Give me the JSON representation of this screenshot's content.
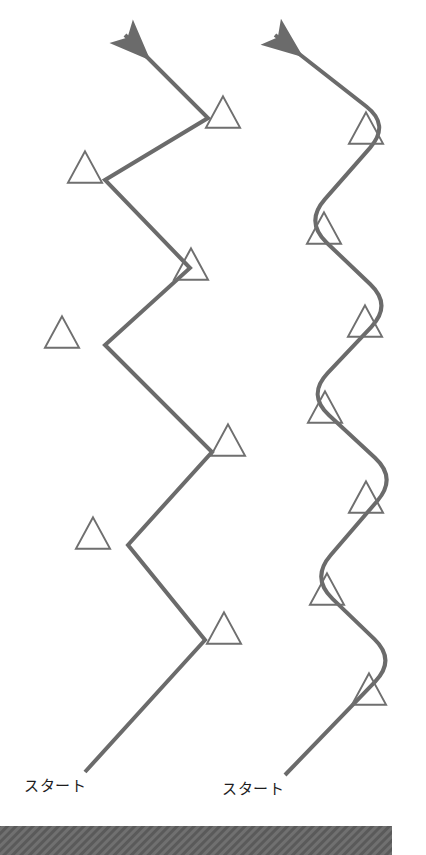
{
  "canvas": {
    "width": 426,
    "height": 855,
    "background": "#ffffff"
  },
  "colors": {
    "stroke": "#6b6b6b",
    "gate_stroke": "#6f6f6f",
    "text": "#1d1d1d",
    "ground_bar": "#707070",
    "ground_hatch": "#5a5a5a"
  },
  "style": {
    "path_stroke_width": 4,
    "gate_stroke_width": 2
  },
  "labels": {
    "left_start": "スタート",
    "right_start": "スタート"
  },
  "left_course": {
    "name": "angular-slalom-course",
    "description": "zig-zag path with sharp corners",
    "start_point": [
      85,
      772
    ],
    "vertices": [
      [
        85,
        772
      ],
      [
        205,
        640
      ],
      [
        128,
        545
      ],
      [
        212,
        452
      ],
      [
        105,
        345
      ],
      [
        190,
        268
      ],
      [
        105,
        180
      ],
      [
        208,
        118
      ],
      [
        125,
        35
      ]
    ],
    "arrow_head": "open-v-barb",
    "gates": [
      {
        "cx": 224,
        "cy": 628,
        "size": 34
      },
      {
        "cx": 93,
        "cy": 533,
        "size": 34
      },
      {
        "cx": 228,
        "cy": 440,
        "size": 34
      },
      {
        "cx": 62,
        "cy": 332,
        "size": 34
      },
      {
        "cx": 191,
        "cy": 264,
        "size": 34
      },
      {
        "cx": 85,
        "cy": 167,
        "size": 34
      },
      {
        "cx": 223,
        "cy": 112,
        "size": 34
      }
    ]
  },
  "right_course": {
    "name": "smooth-slalom-course",
    "description": "zig-zag path with rounded corners",
    "start_point": [
      285,
      775
    ],
    "vertices": [
      [
        285,
        775
      ],
      [
        396,
        660
      ],
      [
        311,
        578
      ],
      [
        397,
        478
      ],
      [
        307,
        395
      ],
      [
        392,
        305
      ],
      [
        305,
        222
      ],
      [
        390,
        125
      ],
      [
        275,
        35
      ]
    ],
    "corner_radius": 30,
    "arrow_head": "open-v-barb",
    "gates": [
      {
        "cx": 369,
        "cy": 689,
        "size": 34
      },
      {
        "cx": 327,
        "cy": 589,
        "size": 34
      },
      {
        "cx": 366,
        "cy": 497,
        "size": 34
      },
      {
        "cx": 325,
        "cy": 407,
        "size": 34
      },
      {
        "cx": 365,
        "cy": 321,
        "size": 34
      },
      {
        "cx": 324,
        "cy": 228,
        "size": 34
      },
      {
        "cx": 366,
        "cy": 128,
        "size": 34
      }
    ]
  },
  "ground": {
    "name": "ground-bar",
    "x": 0,
    "y": 826,
    "width": 392,
    "height": 29
  }
}
